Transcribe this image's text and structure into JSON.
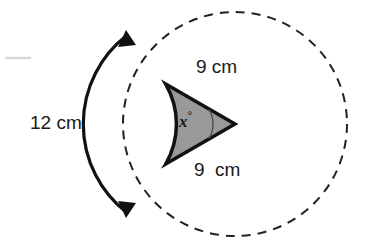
{
  "figure": {
    "background_color": "#ffffff",
    "sector_fill_color": "#999999",
    "outline_color": "#111111",
    "dashed_circle_color": "#222222",
    "text_color": "#1a1a1a"
  },
  "labels": {
    "radius_top": "9 cm",
    "radius_bottom": "9  cm",
    "arc_length": "12 cm",
    "angle": "x",
    "angle_degree_symbol": "°"
  },
  "geometry": {
    "circle_center_x": 235,
    "circle_center_y": 124,
    "dashed_circle_radius": 112,
    "sector_radius": 80,
    "sector_start_angle_deg": 150,
    "sector_end_angle_deg": 210,
    "angle_marker_radius": 30,
    "measure_arc_x": 100,
    "measure_arc_radius": 108
  },
  "icons": {
    "arrow_top": "arrow-head-up",
    "arrow_bottom": "arrow-head-down"
  }
}
